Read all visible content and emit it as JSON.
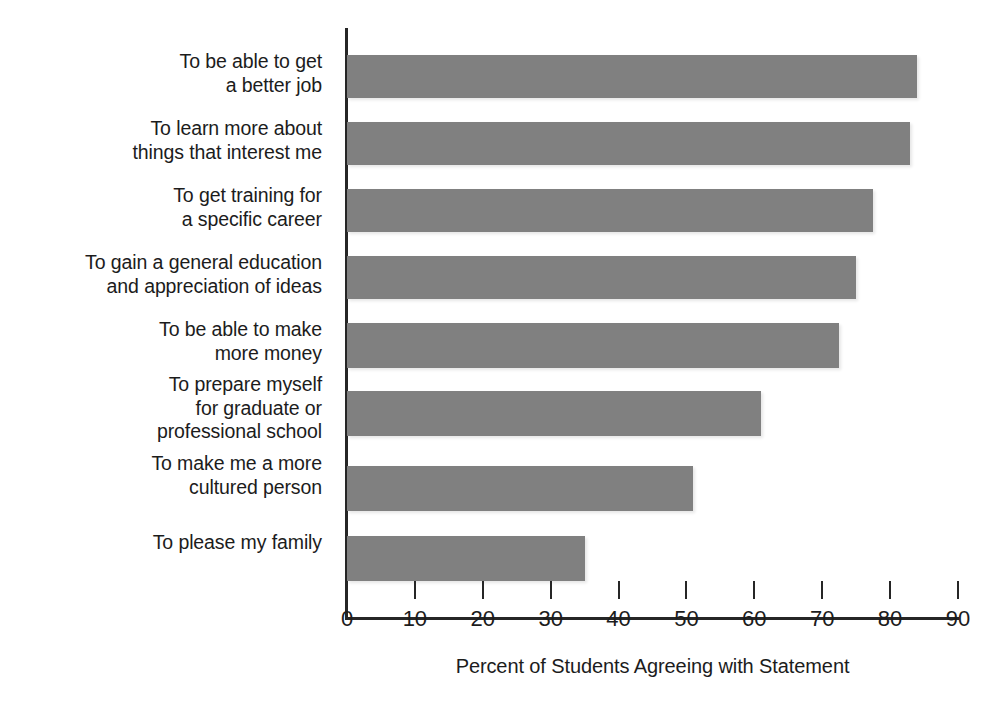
{
  "chart_data": {
    "type": "bar",
    "orientation": "horizontal",
    "title": "",
    "xlabel": "Percent of Students Agreeing with Statement",
    "ylabel": "",
    "xlim": [
      0,
      90
    ],
    "xticks": [
      0,
      10,
      20,
      30,
      40,
      50,
      60,
      70,
      80,
      90
    ],
    "xtick_labels": [
      "0",
      "10",
      "20",
      "30",
      "40",
      "50",
      "60",
      "70",
      "80",
      "90"
    ],
    "grid": false,
    "legend": null,
    "bar_color": "#808080",
    "axis_color": "#262626",
    "categories": [
      "To be able to get\na better job",
      "To learn more about\nthings that interest me",
      "To get training for\na specific career",
      "To gain a general education\nand appreciation of ideas",
      "To be able to make\nmore money",
      "To prepare myself\nfor graduate or\nprofessional school",
      "To make me a more\ncultured person",
      "To please my family"
    ],
    "values": [
      84,
      83,
      77.5,
      75,
      72.5,
      61,
      51,
      35
    ]
  }
}
